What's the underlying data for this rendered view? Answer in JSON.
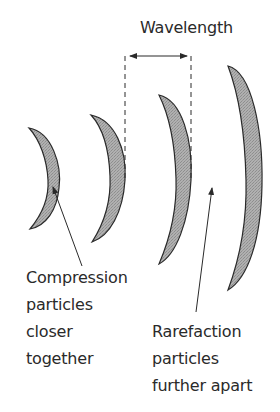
{
  "title": "Wavelength",
  "colors": {
    "crescent_fill": "#a9a9a9",
    "stroke": "#2a2a2a",
    "background": "#ffffff"
  },
  "crescents": [
    {
      "id": 1,
      "top": [
        29,
        128
      ],
      "bottom": [
        30,
        229
      ],
      "outer_bulge_x": 59
    },
    {
      "id": 2,
      "top": [
        91,
        115
      ],
      "bottom": [
        92,
        242
      ],
      "outer_bulge_x": 125
    },
    {
      "id": 3,
      "top": [
        159,
        95
      ],
      "bottom": [
        159,
        264
      ],
      "outer_bulge_x": 191
    },
    {
      "id": 4,
      "top": [
        228,
        66
      ],
      "bottom": [
        228,
        290
      ],
      "outer_bulge_x": 262
    }
  ],
  "wavelength_marker": {
    "left_x": 125,
    "right_x": 191,
    "arrow_y": 56
  },
  "annotations": {
    "compression": {
      "lines": [
        "Compression",
        "particles",
        "closer",
        "together"
      ]
    },
    "rarefaction": {
      "lines": [
        "Rarefaction",
        "particles",
        "further apart"
      ]
    }
  }
}
